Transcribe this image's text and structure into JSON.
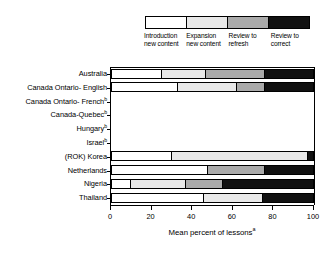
{
  "chart_data": {
    "type": "bar",
    "orientation": "horizontal",
    "stacked": true,
    "title": "",
    "xlabel": "Mean percent of lessons",
    "xlabel_superscript": "a",
    "ylabel": "",
    "xlim": [
      0,
      100
    ],
    "xticks": [
      0,
      20,
      40,
      60,
      80,
      100
    ],
    "xtick_labels": [
      "0",
      "20",
      "40",
      "60",
      "80",
      "100"
    ],
    "grid": false,
    "legend_position": "top",
    "legend": [
      {
        "label": "Introduction new content",
        "color": "#ffffff"
      },
      {
        "label": "Expansion new content",
        "color": "#e8e8e8"
      },
      {
        "label": "Review to refresh",
        "color": "#aaaaaa"
      },
      {
        "label": "Review to correct",
        "color": "#111111"
      }
    ],
    "categories": [
      "Australia",
      "Canada Ontario- English",
      "Canada Ontario- French",
      "Canada-Quebec",
      "Hungary",
      "Israel",
      "(ROK) Korea",
      "Netherlands",
      "Nigeria",
      "Thailand"
    ],
    "category_superscripts": [
      "",
      "",
      "b",
      "b",
      "b",
      "b",
      "",
      "",
      "",
      ""
    ],
    "series": [
      {
        "name": "Introduction new content",
        "values": [
          25,
          33,
          null,
          null,
          null,
          null,
          30,
          48,
          10,
          46
        ]
      },
      {
        "name": "Expansion new content",
        "values": [
          22,
          29,
          null,
          null,
          null,
          null,
          67,
          0,
          27,
          29
        ]
      },
      {
        "name": "Review to refresh",
        "values": [
          29,
          14,
          null,
          null,
          null,
          null,
          0,
          28,
          18,
          0
        ]
      },
      {
        "name": "Review to correct",
        "values": [
          24,
          24,
          null,
          null,
          null,
          null,
          3,
          24,
          45,
          25
        ]
      }
    ],
    "no_data_categories": [
      "Canada Ontario- French",
      "Canada-Quebec",
      "Hungary",
      "Israel"
    ]
  }
}
